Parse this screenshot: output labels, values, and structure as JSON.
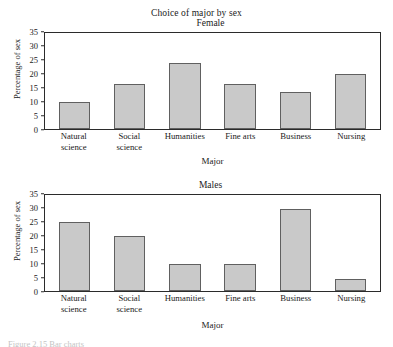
{
  "figure": {
    "title": "Choice of major by sex",
    "caption_partial": "Figure 2.15  Bar charts"
  },
  "chart_data": [
    {
      "type": "bar",
      "title": "Female",
      "panel_key": "female",
      "categories": [
        "Natural science",
        "Social science",
        "Humanities",
        "Fine arts",
        "Business",
        "Nursing"
      ],
      "category_lines": [
        [
          "Natural",
          "science"
        ],
        [
          "Social",
          "science"
        ],
        [
          "Humanities"
        ],
        [
          "Fine arts"
        ],
        [
          "Business"
        ],
        [
          "Nursing"
        ]
      ],
      "values": [
        10,
        16.5,
        24,
        16.5,
        13.5,
        20
      ],
      "xlabel": "Major",
      "ylabel": "Percentage of sex",
      "ylim": [
        0,
        35
      ],
      "yticks": [
        0,
        5,
        10,
        15,
        20,
        25,
        30,
        35
      ],
      "grid": false,
      "legend": "none",
      "bar_fill": "#c9c9c9",
      "bar_edge": "#606060"
    },
    {
      "type": "bar",
      "title": "Males",
      "panel_key": "male",
      "categories": [
        "Natural science",
        "Social science",
        "Humanities",
        "Fine arts",
        "Business",
        "Nursing"
      ],
      "category_lines": [
        [
          "Natural",
          "science"
        ],
        [
          "Social",
          "science"
        ],
        [
          "Humanities"
        ],
        [
          "Fine arts"
        ],
        [
          "Business"
        ],
        [
          "Nursing"
        ]
      ],
      "values": [
        25,
        20,
        10,
        10,
        30,
        4.5
      ],
      "xlabel": "Major",
      "ylabel": "Percentage of sex",
      "ylim": [
        0,
        35
      ],
      "yticks": [
        0,
        5,
        10,
        15,
        20,
        25,
        30,
        35
      ],
      "grid": false,
      "legend": "none",
      "bar_fill": "#c9c9c9",
      "bar_edge": "#606060"
    }
  ]
}
